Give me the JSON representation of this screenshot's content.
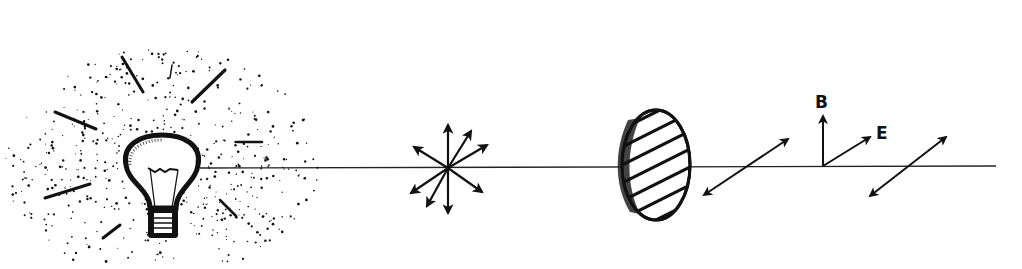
{
  "diagram": {
    "type": "light-polarization-illustration",
    "colors": {
      "ink": "#111111",
      "background": "#ffffff"
    },
    "elements": [
      {
        "id": "light-source",
        "kind": "light-bulb",
        "description": "Incandescent bulb radiating light (stippled glow with rays)"
      },
      {
        "id": "beam",
        "kind": "line",
        "description": "Horizontal light beam path from bulb to right edge"
      },
      {
        "id": "unpolarized-symbol",
        "kind": "arrow-star",
        "description": "Multiple arrows in all directions (unpolarized light)",
        "arrow_count": 8
      },
      {
        "id": "polarizer",
        "kind": "ellipse-with-hatching",
        "description": "Polarizing filter with diagonal hatch lines"
      },
      {
        "id": "polarized-arrow-1",
        "kind": "double-arrow",
        "description": "Polarized light oscillation direction after filter"
      },
      {
        "id": "field-axes",
        "kind": "vector-pair",
        "description": "Magnetic field B (vertical) and electric field E (diagonal)"
      },
      {
        "id": "polarized-arrow-2",
        "kind": "double-arrow",
        "description": "Polarized light oscillation direction further along beam"
      }
    ],
    "labels": {
      "b_field": "B",
      "e_field": "E"
    }
  }
}
